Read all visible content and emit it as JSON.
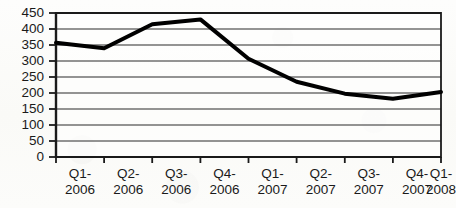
{
  "chart_data": {
    "type": "line",
    "title": "",
    "subtitle": "",
    "xlabel": "",
    "ylabel": "",
    "categories": [
      "Q1-2006",
      "Q2-2006",
      "Q3-2006",
      "Q4-2006",
      "Q1-2007",
      "Q2-2007",
      "Q3-2007",
      "Q4-2007",
      "Q1-2008"
    ],
    "category_lines": [
      [
        "Q1-",
        "2006"
      ],
      [
        "Q2-",
        "2006"
      ],
      [
        "Q3-",
        "2006"
      ],
      [
        "Q4-",
        "2006"
      ],
      [
        "Q1-",
        "2007"
      ],
      [
        "Q2-",
        "2007"
      ],
      [
        "Q3-",
        "2007"
      ],
      [
        "Q4-",
        "2007"
      ],
      [
        "Q1-",
        "2008"
      ]
    ],
    "values": [
      357,
      340,
      415,
      430,
      307,
      235,
      198,
      182,
      203
    ],
    "ylim": [
      0,
      450
    ],
    "ytick_labels": [
      "0",
      "50",
      "100",
      "150",
      "200",
      "250",
      "300",
      "350",
      "400",
      "450"
    ],
    "ytick_values": [
      0,
      50,
      100,
      150,
      200,
      250,
      300,
      350,
      400,
      450
    ],
    "grid": "horizontal",
    "legend": "none",
    "legend_position": "",
    "series": [
      {
        "name": "",
        "values": [
          357,
          340,
          415,
          430,
          307,
          235,
          198,
          182,
          203
        ],
        "color": "#000000",
        "line_width": 4,
        "markers": "none"
      }
    ],
    "annotations": []
  },
  "axes": {
    "plot_left": 56,
    "plot_right": 441,
    "plot_top": 13,
    "plot_bottom": 157,
    "border_color": "#1a1a1a",
    "gridline_color": "#2b2b2b",
    "tick_color": "#1a1a1a"
  },
  "colors": {
    "background": "#fbfbf9",
    "ink": "#1a1a1a",
    "series_line": "#000000"
  }
}
